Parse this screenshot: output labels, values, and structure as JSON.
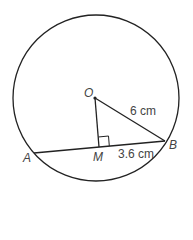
{
  "diagram": {
    "points": {
      "O": "O",
      "A": "A",
      "B": "B",
      "M": "M"
    },
    "labels": {
      "OB": "6 cm",
      "MB": "3.6 cm"
    },
    "colors": {
      "stroke": "#222222",
      "text": "#444444"
    }
  }
}
